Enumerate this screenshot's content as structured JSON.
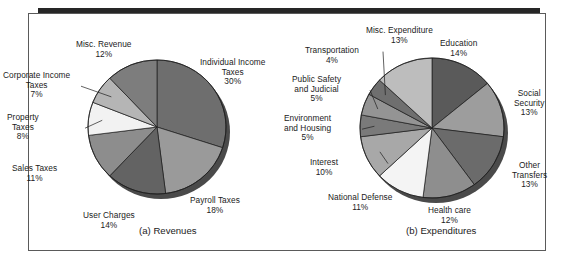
{
  "figure": {
    "background": "#ffffff",
    "frame_color": "#5a5a5a",
    "rule_color": "#262626"
  },
  "panels": [
    {
      "id": "a",
      "caption": "(a) Revenues",
      "caption_left": 139,
      "caption_top": 212
    },
    {
      "id": "b",
      "caption": "(b) Expenditures",
      "caption_top": 212,
      "caption_left": 118
    }
  ],
  "chart_data": [
    {
      "type": "pie",
      "title": "(a) Revenues",
      "start_angle": 0,
      "direction": "clockwise",
      "legend": "labels-outside",
      "categories": [
        "Individual Income Taxes",
        "Payroll Taxes",
        "User Charges",
        "Sales Taxes",
        "Property Taxes",
        "Corporate Income Taxes",
        "Misc. Revenue"
      ],
      "values": [
        30,
        18,
        14,
        11,
        8,
        7,
        12
      ],
      "value_labels": [
        "30%",
        "18%",
        "14%",
        "11%",
        "8%",
        "7%",
        "12%"
      ],
      "colors": [
        "#6e6e6e",
        "#9a9a9a",
        "#636363",
        "#8d8d8d",
        "#f2f2f2",
        "#b5b5b5",
        "#7d7d7d"
      ],
      "labels": [
        {
          "lines": [
            "Individual Income",
            "Taxes"
          ],
          "pct": "30%",
          "x": 200,
          "y": 45,
          "align": "c",
          "leader": false
        },
        {
          "lines": [
            "Payroll Taxes"
          ],
          "pct": "18%",
          "x": 190,
          "y": 183,
          "align": "c",
          "leader": false
        },
        {
          "lines": [
            "User Charges"
          ],
          "pct": "14%",
          "x": 83,
          "y": 198,
          "align": "c",
          "leader": false
        },
        {
          "lines": [
            "Sales Taxes"
          ],
          "pct": "11%",
          "x": 12,
          "y": 151,
          "align": "c",
          "leader": false
        },
        {
          "lines": [
            "Property",
            "Taxes"
          ],
          "pct": "8%",
          "x": 7,
          "y": 100,
          "align": "c",
          "leader": true
        },
        {
          "lines": [
            "Corporate Income",
            "Taxes"
          ],
          "pct": "7%",
          "x": 3,
          "y": 58,
          "align": "c",
          "leader": true
        },
        {
          "lines": [
            "Misc. Revenue"
          ],
          "pct": "12%",
          "x": 76,
          "y": 27,
          "align": "c",
          "leader": false
        }
      ]
    },
    {
      "type": "pie",
      "title": "(b) Expenditures",
      "start_angle": 0,
      "direction": "clockwise",
      "legend": "labels-outside",
      "categories": [
        "Education",
        "Social Security",
        "Other Transfers",
        "Health care",
        "National Defense",
        "Interest",
        "Environment and Housing",
        "Public Safety and Judicial",
        "Transportation",
        "Misc. Expenditure"
      ],
      "values": [
        14,
        13,
        13,
        12,
        11,
        10,
        5,
        5,
        4,
        13
      ],
      "value_labels": [
        "14%",
        "13%",
        "13%",
        "12%",
        "11%",
        "10%",
        "5%",
        "5%",
        "4%",
        "13%"
      ],
      "colors": [
        "#5a5a5a",
        "#9d9d9d",
        "#6b6b6b",
        "#8e8e8e",
        "#f4f4f4",
        "#a8a8a8",
        "#7a7a7a",
        "#949494",
        "#6f6f6f",
        "#bdbdbd"
      ],
      "labels": [
        {
          "lines": [
            "Education"
          ],
          "pct": "14%",
          "x": 152,
          "y": 26,
          "align": "c",
          "leader": false
        },
        {
          "lines": [
            "Social",
            "Security"
          ],
          "pct": "13%",
          "x": 226,
          "y": 76,
          "align": "c",
          "leader": false
        },
        {
          "lines": [
            "Other",
            "Transfers"
          ],
          "pct": "13%",
          "x": 224,
          "y": 148,
          "align": "c",
          "leader": false
        },
        {
          "lines": [
            "Health care"
          ],
          "pct": "12%",
          "x": 140,
          "y": 193,
          "align": "c",
          "leader": false
        },
        {
          "lines": [
            "National Defense"
          ],
          "pct": "11%",
          "x": 40,
          "y": 180,
          "align": "c",
          "leader": false
        },
        {
          "lines": [
            "Interest"
          ],
          "pct": "10%",
          "x": 22,
          "y": 145,
          "align": "c",
          "leader": true
        },
        {
          "lines": [
            "Environment",
            "and Housing"
          ],
          "pct": "5%",
          "x": -4,
          "y": 101,
          "align": "c",
          "leader": true
        },
        {
          "lines": [
            "Public Safety",
            "and Judicial"
          ],
          "pct": "5%",
          "x": 4,
          "y": 62,
          "align": "c",
          "leader": true
        },
        {
          "lines": [
            "Transportation"
          ],
          "pct": "4%",
          "x": 17,
          "y": 33,
          "align": "c",
          "leader": true
        },
        {
          "lines": [
            "Misc. Expenditure"
          ],
          "pct": "13%",
          "x": 78,
          "y": 13,
          "align": "c",
          "leader": false
        }
      ]
    }
  ]
}
